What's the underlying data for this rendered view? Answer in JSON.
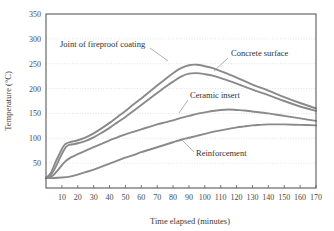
{
  "chart_data": {
    "type": "line",
    "title": "",
    "xlabel": "Time elapsed (minutes)",
    "ylabel": "Temperature (°C)",
    "xlim": [
      0,
      170
    ],
    "ylim": [
      0,
      350
    ],
    "grid": true,
    "legend_position": "inline-annotations",
    "xticks": [
      10,
      20,
      30,
      40,
      50,
      60,
      70,
      80,
      90,
      100,
      110,
      120,
      130,
      140,
      150,
      160,
      170
    ],
    "xtick_labels": [
      "10",
      "20",
      "30",
      "40",
      "50",
      "60",
      "70",
      "80",
      "90",
      "100",
      "110",
      "120",
      "130",
      "140",
      "150",
      "160",
      "170"
    ],
    "yticks": [
      0,
      50,
      100,
      150,
      200,
      250,
      300,
      350
    ],
    "ytick_labels": [
      "",
      "50",
      "100",
      "150",
      "200",
      "250",
      "300",
      "350"
    ],
    "series": [
      {
        "name": "Joint of fireproof coating",
        "color": "#8a8a8a",
        "x": [
          0,
          3,
          6,
          9,
          11,
          13,
          16,
          20,
          25,
          30,
          35,
          40,
          45,
          50,
          55,
          60,
          65,
          70,
          75,
          80,
          85,
          90,
          95,
          100,
          105,
          110,
          120,
          130,
          140,
          150,
          160,
          170
        ],
        "y": [
          20,
          30,
          52,
          72,
          84,
          90,
          93,
          96,
          102,
          110,
          120,
          131,
          143,
          155,
          168,
          180,
          193,
          206,
          219,
          231,
          241,
          247,
          248,
          245,
          241,
          235,
          222,
          208,
          196,
          183,
          171,
          160
        ]
      },
      {
        "name": "Concrete surface",
        "color": "#8a8a8a",
        "x": [
          0,
          3,
          6,
          9,
          12,
          14,
          17,
          20,
          25,
          30,
          35,
          40,
          45,
          50,
          55,
          60,
          65,
          70,
          75,
          80,
          85,
          90,
          95,
          100,
          105,
          110,
          120,
          130,
          140,
          150,
          160,
          170
        ],
        "y": [
          20,
          26,
          42,
          62,
          80,
          86,
          88,
          90,
          95,
          102,
          111,
          121,
          132,
          143,
          155,
          167,
          179,
          191,
          203,
          214,
          224,
          230,
          231,
          229,
          226,
          221,
          210,
          198,
          187,
          175,
          164,
          155
        ]
      },
      {
        "name": "Ceramic insert",
        "color": "#8a8a8a",
        "x": [
          0,
          4,
          8,
          12,
          16,
          20,
          25,
          30,
          35,
          40,
          45,
          50,
          55,
          60,
          65,
          70,
          75,
          80,
          85,
          90,
          95,
          100,
          105,
          110,
          115,
          120,
          125,
          130,
          140,
          150,
          160,
          170
        ],
        "y": [
          20,
          24,
          38,
          53,
          62,
          68,
          75,
          82,
          89,
          96,
          102,
          108,
          113,
          118,
          123,
          128,
          132,
          136,
          141,
          145,
          149,
          152,
          155,
          157,
          158,
          157,
          156,
          154,
          150,
          145,
          140,
          135
        ]
      },
      {
        "name": "Reinforcement",
        "color": "#8a8a8a",
        "x": [
          0,
          5,
          10,
          15,
          20,
          25,
          30,
          35,
          40,
          45,
          50,
          55,
          60,
          65,
          70,
          75,
          80,
          85,
          90,
          95,
          100,
          105,
          110,
          115,
          120,
          125,
          130,
          135,
          140,
          145,
          150,
          160,
          170
        ],
        "y": [
          20,
          20,
          21,
          23,
          27,
          32,
          37,
          43,
          49,
          55,
          61,
          66,
          72,
          77,
          82,
          87,
          92,
          97,
          101,
          105,
          109,
          113,
          116,
          119,
          122,
          124,
          126,
          127,
          128,
          128,
          128,
          127,
          126
        ]
      }
    ],
    "annotations": [
      {
        "text": "Joint of fireproof coating",
        "tx": 60,
        "ty": 47,
        "lx1": 150,
        "ly1": 48,
        "lx2": 168,
        "ly2": 61
      },
      {
        "text": "Concrete surface",
        "tx": 231,
        "ty": 56,
        "lx1": 228,
        "ly1": 58,
        "lx2": 214,
        "ly2": 71
      },
      {
        "text": "Ceramic insert",
        "tx": 190,
        "ty": 98,
        "lx1": 188,
        "ly1": 100,
        "lx2": 179,
        "ly2": 113
      },
      {
        "text": "Reinforcement",
        "tx": 196,
        "ty": 156,
        "lx1": 194,
        "ly1": 152,
        "lx2": 181,
        "ly2": 139
      }
    ]
  }
}
